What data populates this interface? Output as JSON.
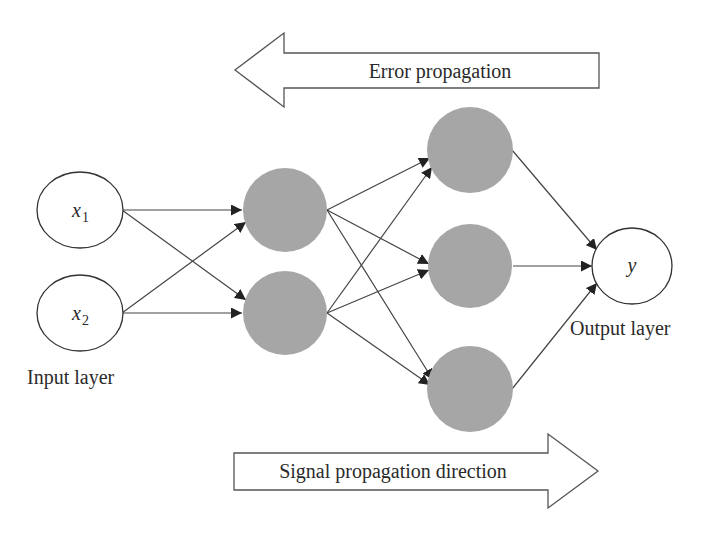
{
  "diagram": {
    "type": "neural-network-backpropagation",
    "error_arrow": {
      "label": "Error propagation",
      "direction": "left"
    },
    "signal_arrow": {
      "label": "Signal propagation direction",
      "direction": "right"
    },
    "input_layer": {
      "label": "Input layer",
      "nodes": [
        {
          "var": "x",
          "sub": "1"
        },
        {
          "var": "x",
          "sub": "2"
        }
      ]
    },
    "hidden_layers": [
      {
        "node_count": 2
      },
      {
        "node_count": 3
      }
    ],
    "output_layer": {
      "label": "Output layer",
      "nodes": [
        {
          "var": "y"
        }
      ]
    },
    "colors": {
      "hidden_node": "#a6a6a6",
      "stroke": "#333333",
      "background": "#ffffff"
    },
    "connections": "fully-connected"
  }
}
